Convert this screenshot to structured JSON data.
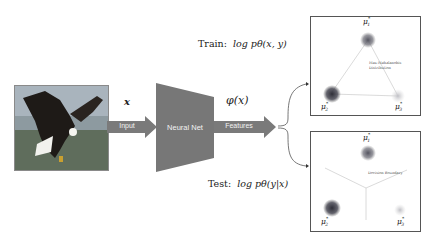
{
  "input": {
    "image": "bald-eagle-photo",
    "variable": "x",
    "arrow_label": "Input"
  },
  "network": {
    "label": "Neural Net",
    "color": "#777777"
  },
  "features": {
    "variable": "φ(x)",
    "arrow_label": "Features"
  },
  "branches": {
    "train": {
      "label": "Train:",
      "objective": "log pθ(x, y)"
    },
    "test": {
      "label": "Test:",
      "objective": "log pθ(y|x)"
    }
  },
  "panels": {
    "train": {
      "annotation_line1": "Max-Mahalanobis",
      "annotation_line2": "Distribution",
      "centers": [
        {
          "name": "μ",
          "sub": "1",
          "sup": "*"
        },
        {
          "name": "μ",
          "sub": "2",
          "sup": "*"
        },
        {
          "name": "μ",
          "sub": "3",
          "sup": "*"
        }
      ]
    },
    "test": {
      "annotation": "Decision Boundary",
      "centers": [
        {
          "name": "μ",
          "sub": "1",
          "sup": "*"
        },
        {
          "name": "μ",
          "sub": "2",
          "sup": "*"
        },
        {
          "name": "μ",
          "sub": "3",
          "sup": "*"
        }
      ]
    }
  },
  "colors": {
    "arrow": "#7a7a7a",
    "cluster_dark": "#2f2f38",
    "cluster_mid": "#555560",
    "cluster_light": "#c8c8cc"
  }
}
